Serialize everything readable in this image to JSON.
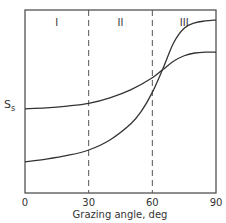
{
  "chart_data": {
    "type": "line",
    "title": "",
    "xlabel": "Grazing angle, deg",
    "ylabel": "S_s",
    "ylabel_main": "S",
    "ylabel_sub": "s",
    "xlim": [
      0,
      90
    ],
    "ylim": [
      0,
      1
    ],
    "x_ticks": [
      0,
      30,
      60,
      90
    ],
    "x_tick_labels": [
      "0",
      "30",
      "60",
      "90"
    ],
    "grid": false,
    "region_dividers": [
      30,
      60
    ],
    "regions": [
      {
        "label": "I",
        "x": 15
      },
      {
        "label": "II",
        "x": 45
      },
      {
        "label": "III",
        "x": 75
      }
    ],
    "series": [
      {
        "name": "curve-a",
        "x": [
          0,
          10,
          20,
          30,
          40,
          50,
          60,
          65,
          70,
          75,
          80,
          85,
          90
        ],
        "y": [
          0.46,
          0.465,
          0.475,
          0.49,
          0.52,
          0.565,
          0.63,
          0.675,
          0.72,
          0.75,
          0.765,
          0.77,
          0.77
        ]
      },
      {
        "name": "curve-b",
        "x": [
          0,
          10,
          20,
          30,
          40,
          50,
          55,
          60,
          65,
          70,
          75,
          80,
          85,
          90
        ],
        "y": [
          0.17,
          0.185,
          0.205,
          0.235,
          0.29,
          0.38,
          0.45,
          0.55,
          0.68,
          0.82,
          0.9,
          0.93,
          0.94,
          0.945
        ]
      }
    ]
  }
}
